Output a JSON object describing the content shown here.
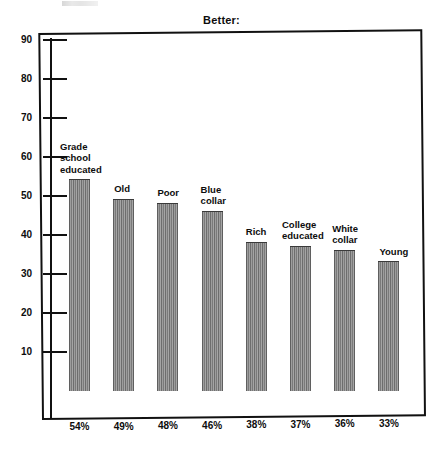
{
  "chart_data": {
    "type": "bar",
    "title": "Better:",
    "xlabel": "",
    "ylabel": "",
    "ylim": [
      0,
      95
    ],
    "grid": false,
    "legend": null,
    "tick_labels": [
      "90",
      "80",
      "70",
      "60",
      "50",
      "40",
      "30",
      "20",
      "10"
    ],
    "ticks": [
      90,
      80,
      70,
      60,
      50,
      40,
      30,
      20,
      10
    ],
    "categories": [
      "Grade school educated",
      "Old",
      "Poor",
      "Blue collar",
      "Rich",
      "College educated",
      "White collar",
      "Young"
    ],
    "category_labels": [
      "Grade\nschool\neducated",
      "Old",
      "Poor",
      "Blue\ncollar",
      "Rich",
      "College\neducated",
      "White\ncollar",
      "Young"
    ],
    "values": [
      54,
      49,
      48,
      46,
      38,
      37,
      36,
      33
    ],
    "value_labels": [
      "54%",
      "49%",
      "48%",
      "46%",
      "38%",
      "37%",
      "36%",
      "33%"
    ],
    "bar_color": "#8b8b8b"
  },
  "axis": {
    "ticks": [
      {
        "label": "90",
        "value": 90
      },
      {
        "label": "80",
        "value": 80
      },
      {
        "label": "70",
        "value": 70
      },
      {
        "label": "60",
        "value": 60
      },
      {
        "label": "50",
        "value": 50
      },
      {
        "label": "40",
        "value": 40
      },
      {
        "label": "30",
        "value": 30
      },
      {
        "label": "20",
        "value": 20
      },
      {
        "label": "10",
        "value": 10
      }
    ]
  }
}
